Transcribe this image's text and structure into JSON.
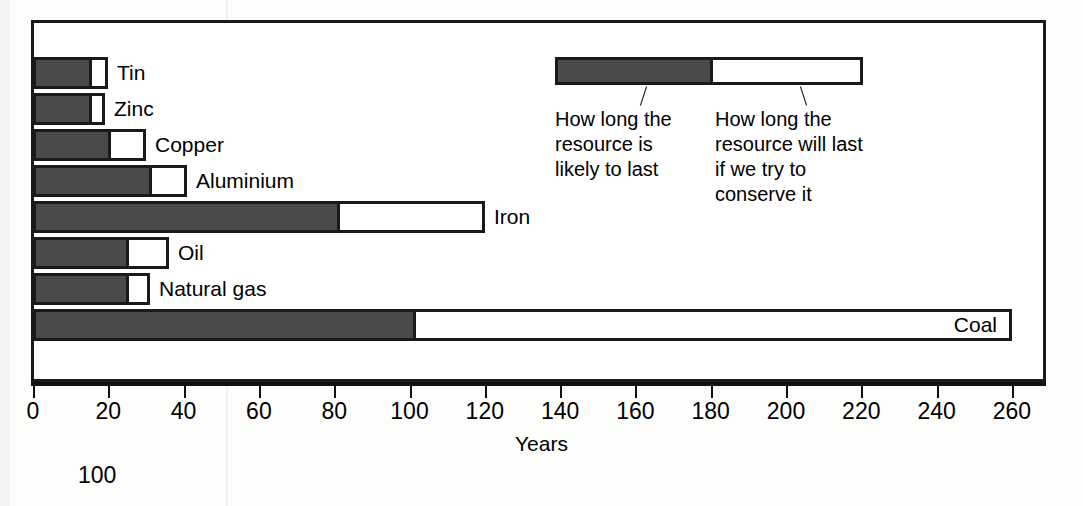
{
  "chart_data": {
    "type": "bar",
    "orientation": "horizontal",
    "stacked": true,
    "title": "",
    "xlabel": "Years",
    "ylabel": "",
    "xlim": [
      0,
      270
    ],
    "xticks": [
      0,
      20,
      40,
      60,
      80,
      100,
      120,
      140,
      160,
      180,
      200,
      220,
      240,
      260
    ],
    "xtick_labels": [
      "0",
      "20",
      "40",
      "60",
      "80",
      "100",
      "120",
      "140",
      "160",
      "180",
      "200",
      "220",
      "240",
      "260"
    ],
    "grid": false,
    "categories": [
      "Tin",
      "Zinc",
      "Copper",
      "Aluminium",
      "Iron",
      "Oil",
      "Natural gas",
      "Coal"
    ],
    "series": [
      {
        "name": "How long the resource is likely to last",
        "color": "#4a4a4a",
        "values": [
          14,
          14,
          19,
          30,
          80,
          24,
          24,
          100
        ]
      },
      {
        "name": "How long the resource will last if we try to conserve it",
        "color": "#ffffff",
        "values": [
          6,
          5,
          11,
          11,
          40,
          12,
          7,
          160
        ]
      }
    ],
    "totals": [
      20,
      19,
      30,
      41,
      120,
      36,
      31,
      260
    ],
    "legend_position": "inside-top-right",
    "annotations": [
      "100"
    ]
  },
  "axis": {
    "title": "Years",
    "ticks": [
      {
        "value": 0,
        "label": "0"
      },
      {
        "value": 20,
        "label": "20"
      },
      {
        "value": 40,
        "label": "40"
      },
      {
        "value": 60,
        "label": "60"
      },
      {
        "value": 80,
        "label": "80"
      },
      {
        "value": 100,
        "label": "100"
      },
      {
        "value": 120,
        "label": "120"
      },
      {
        "value": 140,
        "label": "140"
      },
      {
        "value": 160,
        "label": "160"
      },
      {
        "value": 180,
        "label": "180"
      },
      {
        "value": 200,
        "label": "200"
      },
      {
        "value": 220,
        "label": "220"
      },
      {
        "value": 240,
        "label": "240"
      },
      {
        "value": 260,
        "label": "260"
      }
    ]
  },
  "legend": {
    "dark_text": "How long the\nresource is\nlikely to last",
    "light_text": "How long the\nresource will last\nif we try to\nconserve it"
  },
  "stray_number": "100",
  "colors": {
    "dark_segment": "#4a4a4a",
    "light_segment": "#ffffff",
    "outline": "#1a1a1a",
    "background": "#ffffff"
  }
}
